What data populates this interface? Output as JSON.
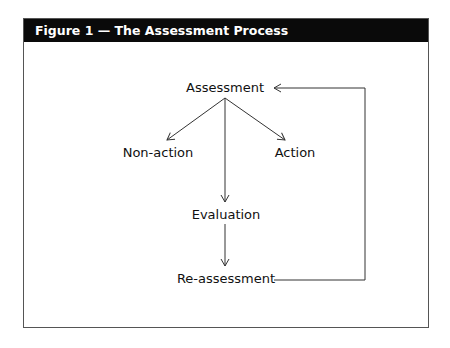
{
  "figure": {
    "title": "Figure 1 — The Assessment Process"
  },
  "diagram": {
    "nodes": {
      "assessment": "Assessment",
      "non_action": "Non-action",
      "action": "Action",
      "evaluation": "Evaluation",
      "reassessment": "Re-assessment"
    },
    "edges": [
      {
        "from": "Assessment",
        "to": "Non-action"
      },
      {
        "from": "Assessment",
        "to": "Action"
      },
      {
        "from": "Assessment",
        "to": "Evaluation"
      },
      {
        "from": "Evaluation",
        "to": "Re-assessment"
      },
      {
        "from": "Re-assessment",
        "to": "Assessment"
      }
    ]
  }
}
